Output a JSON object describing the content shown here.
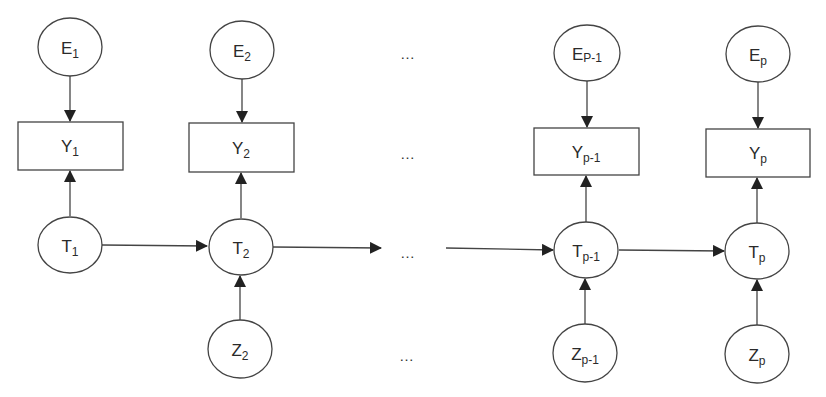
{
  "diagram": {
    "type": "state-space model (hidden Markov chain)",
    "top_row": [
      {
        "id": "E1",
        "main": "E",
        "sub": "1"
      },
      {
        "id": "E2",
        "main": "E",
        "sub": "2"
      },
      {
        "id": "EP-1",
        "main": "E",
        "sub": "P-1"
      },
      {
        "id": "Ep",
        "main": "E",
        "sub": "p"
      }
    ],
    "obs_row": [
      {
        "id": "Y1",
        "main": "Y",
        "sub": "1"
      },
      {
        "id": "Y2",
        "main": "Y",
        "sub": "2"
      },
      {
        "id": "Yp-1",
        "main": "Y",
        "sub": "p-1"
      },
      {
        "id": "Yp",
        "main": "Y",
        "sub": "p"
      }
    ],
    "state_row": [
      {
        "id": "T1",
        "main": "T",
        "sub": "1"
      },
      {
        "id": "T2",
        "main": "T",
        "sub": "2"
      },
      {
        "id": "Tp-1",
        "main": "T",
        "sub": "p-1"
      },
      {
        "id": "Tp",
        "main": "T",
        "sub": "p"
      }
    ],
    "input_row": [
      {
        "id": "Z2",
        "main": "Z",
        "sub": "2"
      },
      {
        "id": "Zp-1",
        "main": "Z",
        "sub": "p-1"
      },
      {
        "id": "Zp",
        "main": "Z",
        "sub": "p"
      }
    ],
    "ellipsis": "…",
    "edges": [
      [
        "E1",
        "Y1"
      ],
      [
        "E2",
        "Y2"
      ],
      [
        "EP-1",
        "Yp-1"
      ],
      [
        "Ep",
        "Yp"
      ],
      [
        "T1",
        "Y1"
      ],
      [
        "T2",
        "Y2"
      ],
      [
        "Tp-1",
        "Yp-1"
      ],
      [
        "Tp",
        "Yp"
      ],
      [
        "T1",
        "T2"
      ],
      [
        "T2",
        "…"
      ],
      [
        "…",
        "Tp-1"
      ],
      [
        "Tp-1",
        "Tp"
      ],
      [
        "Z2",
        "T2"
      ],
      [
        "Zp-1",
        "Tp-1"
      ],
      [
        "Zp",
        "Tp"
      ]
    ],
    "colors": {
      "stroke": "#333333",
      "background": "#ffffff"
    }
  }
}
